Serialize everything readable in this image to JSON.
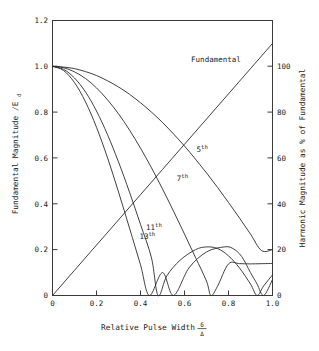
{
  "chart_data": {
    "type": "line",
    "title": "",
    "xlabel": "Relative Pulse Width",
    "xlabel_fraction": {
      "numerator": "δ",
      "denominator": "Δ"
    },
    "ylabel_left": "Fundamental Magnitude /E",
    "ylabel_left_subscript": "d",
    "ylabel_right": "Harmonic Magnitude as % of Fundamental",
    "xlim": [
      0,
      1.0
    ],
    "ylim_left": [
      0,
      1.2
    ],
    "ylim_right": [
      0,
      120
    ],
    "xticks": [
      0,
      0.2,
      0.4,
      0.6,
      0.8,
      1.0
    ],
    "xticklabels": [
      "0",
      "0.2",
      "0.4",
      "0.6",
      "0.8",
      "1.0"
    ],
    "yticks_left": [
      0,
      0.2,
      0.4,
      0.6,
      0.8,
      1.0,
      1.2
    ],
    "yticklabels_left": [
      "0",
      "0.2",
      "0.4",
      "0.6",
      "0.8",
      "1.0",
      "1.2"
    ],
    "yticks_right": [
      0,
      20,
      40,
      60,
      80,
      100
    ],
    "yticklabels_right": [
      "0",
      "20",
      "40",
      "60",
      "80",
      "100"
    ],
    "grid": false,
    "legend": "inline-annotations",
    "series": [
      {
        "name": "Fundamental",
        "label": "Fundamental",
        "label_x": 0.63,
        "label_y": 1.02,
        "points": [
          [
            0,
            0
          ],
          [
            0.1,
            0.11
          ],
          [
            0.2,
            0.22
          ],
          [
            0.3,
            0.33
          ],
          [
            0.4,
            0.44
          ],
          [
            0.5,
            0.55
          ],
          [
            0.6,
            0.66
          ],
          [
            0.7,
            0.77
          ],
          [
            0.8,
            0.88
          ],
          [
            0.9,
            0.99
          ],
          [
            1.0,
            1.1
          ]
        ]
      },
      {
        "name": "5th",
        "label": "5",
        "label_sup": "th",
        "label_x": 0.655,
        "label_y": 0.625,
        "points": [
          [
            0,
            1.0
          ],
          [
            0.05,
            0.997
          ],
          [
            0.1,
            0.99
          ],
          [
            0.15,
            0.977
          ],
          [
            0.2,
            0.96
          ],
          [
            0.25,
            0.937
          ],
          [
            0.3,
            0.91
          ],
          [
            0.35,
            0.878
          ],
          [
            0.4,
            0.841
          ],
          [
            0.45,
            0.8
          ],
          [
            0.5,
            0.755
          ],
          [
            0.55,
            0.705
          ],
          [
            0.6,
            0.652
          ],
          [
            0.65,
            0.595
          ],
          [
            0.7,
            0.535
          ],
          [
            0.75,
            0.472
          ],
          [
            0.8,
            0.406
          ],
          [
            0.85,
            0.338
          ],
          [
            0.9,
            0.268
          ],
          [
            0.95,
            0.196
          ],
          [
            1.0,
            0.2
          ]
        ]
      },
      {
        "name": "7th",
        "label": "7",
        "label_sup": "th",
        "label_x": 0.565,
        "label_y": 0.5,
        "points": [
          [
            0,
            1.0
          ],
          [
            0.05,
            0.994
          ],
          [
            0.1,
            0.976
          ],
          [
            0.15,
            0.947
          ],
          [
            0.2,
            0.906
          ],
          [
            0.25,
            0.854
          ],
          [
            0.3,
            0.793
          ],
          [
            0.35,
            0.722
          ],
          [
            0.4,
            0.643
          ],
          [
            0.45,
            0.557
          ],
          [
            0.5,
            0.465
          ],
          [
            0.55,
            0.368
          ],
          [
            0.6,
            0.268
          ],
          [
            0.65,
            0.166
          ],
          [
            0.7,
            0.063
          ],
          [
            0.72,
            0.0
          ],
          [
            0.75,
            0.04
          ],
          [
            0.8,
            0.138
          ],
          [
            0.85,
            0.139
          ],
          [
            0.9,
            0.138
          ],
          [
            1.0,
            0.14
          ]
        ]
      },
      {
        "name": "11th",
        "label": "11",
        "label_sup": "th",
        "label_x": 0.425,
        "label_y": 0.285,
        "points": [
          [
            0,
            1.0
          ],
          [
            0.05,
            0.987
          ],
          [
            0.1,
            0.949
          ],
          [
            0.15,
            0.888
          ],
          [
            0.2,
            0.805
          ],
          [
            0.25,
            0.702
          ],
          [
            0.3,
            0.583
          ],
          [
            0.35,
            0.451
          ],
          [
            0.4,
            0.31
          ],
          [
            0.45,
            0.164
          ],
          [
            0.48,
            0.0
          ],
          [
            0.52,
            0.086
          ],
          [
            0.58,
            0.154
          ],
          [
            0.65,
            0.2
          ],
          [
            0.7,
            0.212
          ],
          [
            0.75,
            0.205
          ],
          [
            0.8,
            0.173
          ],
          [
            0.85,
            0.12
          ],
          [
            0.9,
            0.05
          ],
          [
            0.93,
            0.0
          ],
          [
            0.96,
            0.042
          ],
          [
            1.0,
            0.09
          ]
        ]
      },
      {
        "name": "13th",
        "label": "13",
        "label_sup": "th",
        "label_x": 0.395,
        "label_y": 0.245,
        "points": [
          [
            0,
            1.0
          ],
          [
            0.05,
            0.982
          ],
          [
            0.1,
            0.929
          ],
          [
            0.15,
            0.845
          ],
          [
            0.2,
            0.734
          ],
          [
            0.25,
            0.601
          ],
          [
            0.3,
            0.452
          ],
          [
            0.35,
            0.294
          ],
          [
            0.4,
            0.134
          ],
          [
            0.44,
            0.0
          ],
          [
            0.5,
            0.1
          ],
          [
            0.55,
            0.0
          ],
          [
            0.62,
            0.12
          ],
          [
            0.7,
            0.19
          ],
          [
            0.78,
            0.212
          ],
          [
            0.82,
            0.205
          ],
          [
            0.86,
            0.17
          ],
          [
            0.9,
            0.1
          ],
          [
            0.93,
            0.05
          ],
          [
            0.96,
            0.0
          ],
          [
            1.0,
            0.07
          ]
        ]
      }
    ]
  },
  "axes": {
    "frame_color": "#3a3a3a",
    "curve_color": "#2b2b2b"
  }
}
